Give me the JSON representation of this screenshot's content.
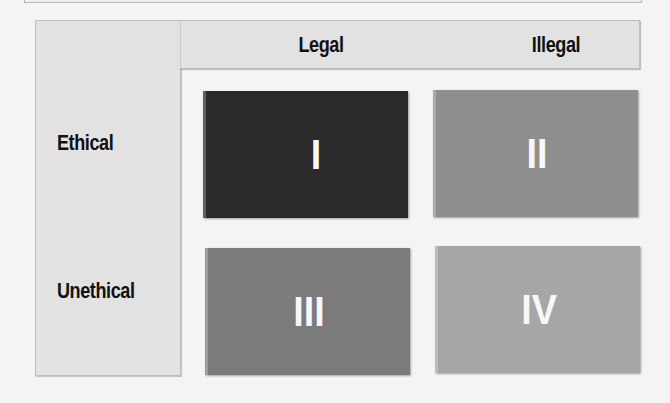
{
  "matrix": {
    "columns": [
      {
        "label": "Legal"
      },
      {
        "label": "Illegal"
      }
    ],
    "rows": [
      {
        "label": "Ethical"
      },
      {
        "label": "Unethical"
      }
    ],
    "cells": [
      {
        "row": "Ethical",
        "column": "Legal",
        "numeral": "I",
        "color": "#2a2a2a"
      },
      {
        "row": "Ethical",
        "column": "Illegal",
        "numeral": "II",
        "color": "#8e8e8e"
      },
      {
        "row": "Unethical",
        "column": "Legal",
        "numeral": "III",
        "color": "#7b7b7b"
      },
      {
        "row": "Unethical",
        "column": "Illegal",
        "numeral": "IV",
        "color": "#a6a6a6"
      }
    ]
  }
}
